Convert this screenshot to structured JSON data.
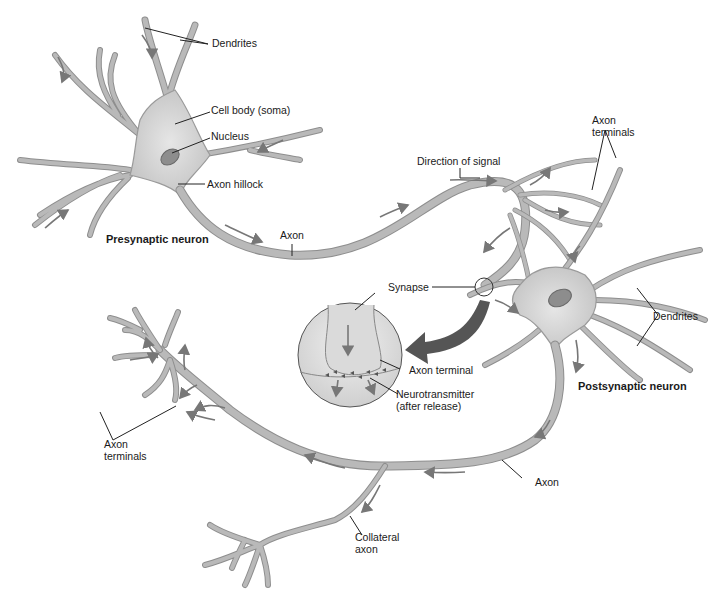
{
  "diagram": {
    "colors": {
      "neuron_fill": "#d4d4d4",
      "neuron_edge": "#8e8e8e",
      "arrow": "#777777",
      "callout_arrow": "#555555",
      "text": "#1a1a1a",
      "background": "#ffffff"
    },
    "labels": {
      "dendrites_top": "Dendrites",
      "cell_body": "Cell body (soma)",
      "nucleus": "Nucleus",
      "axon_hillock": "Axon hillock",
      "presynaptic_neuron": "Presynaptic neuron",
      "axon_top": "Axon",
      "direction_of_signal": "Direction of signal",
      "axon_terminals_top": "Axon\nterminals",
      "synapse": "Synapse",
      "axon_terminal_inset": "Axon terminal",
      "neurotransmitter": "Neurotransmitter\n(after release)",
      "dendrites_right": "Dendrites",
      "postsynaptic_neuron": "Postsynaptic neuron",
      "axon_bottom": "Axon",
      "axon_terminals_left": "Axon\nterminals",
      "collateral_axon": "Collateral\naxon"
    },
    "structures": [
      {
        "name": "presynaptic-neuron",
        "parts": [
          "dendrites",
          "cell body (soma)",
          "nucleus",
          "axon hillock",
          "axon",
          "axon terminals"
        ]
      },
      {
        "name": "synapse-inset",
        "parts": [
          "axon terminal",
          "neurotransmitter (after release)"
        ]
      },
      {
        "name": "postsynaptic-neuron",
        "parts": [
          "dendrites",
          "cell body",
          "axon",
          "collateral axon",
          "axon terminals"
        ]
      }
    ]
  }
}
